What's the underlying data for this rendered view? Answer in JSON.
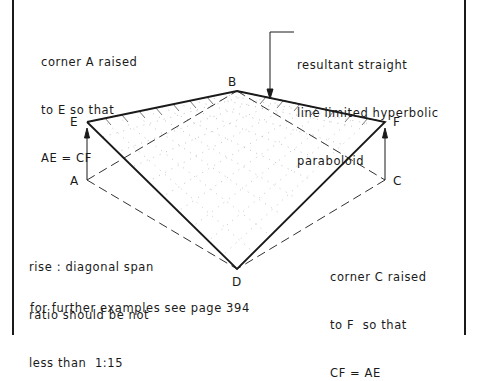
{
  "diagram": {
    "subject": "straight line limited hyperbolic paraboloid",
    "points": {
      "A": {
        "label": "A",
        "x": 87,
        "y": 180
      },
      "B": {
        "label": "B",
        "x": 237,
        "y": 91
      },
      "C": {
        "label": "C",
        "x": 385,
        "y": 180
      },
      "D": {
        "label": "D",
        "x": 237,
        "y": 269
      },
      "E": {
        "label": "E",
        "x": 87,
        "y": 122
      },
      "F": {
        "label": "F",
        "x": 385,
        "y": 122
      }
    }
  },
  "notes": {
    "top_left": [
      "corner A raised",
      "to E so that",
      "AE = CF"
    ],
    "top_right": [
      "resultant straight",
      "line limited hyperbolic",
      "paraboloid"
    ],
    "bottom_left": [
      "rise : diagonal span",
      "ratio should be not",
      "less than  1:15"
    ],
    "bottom_right": [
      "corner C raised",
      "to F  so that",
      "CF = AE"
    ],
    "footer": "for further examples see page 394"
  },
  "colors": {
    "ink": "#1a1a1a",
    "background": "#ffffff"
  }
}
